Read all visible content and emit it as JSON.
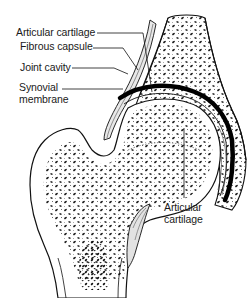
{
  "figure": {
    "labels": [
      {
        "id": "articular-cartilage-top",
        "lines": [
          "Articular cartilage"
        ]
      },
      {
        "id": "fibrous-capsule",
        "lines": [
          "Fibrous capsule"
        ]
      },
      {
        "id": "joint-cavity",
        "lines": [
          "Joint cavity"
        ]
      },
      {
        "id": "synovial-membrane",
        "lines": [
          "Synovial",
          "membrane"
        ]
      },
      {
        "id": "articular-cartilage-bottom",
        "lines": [
          "Articular",
          "cartilage"
        ]
      }
    ]
  }
}
